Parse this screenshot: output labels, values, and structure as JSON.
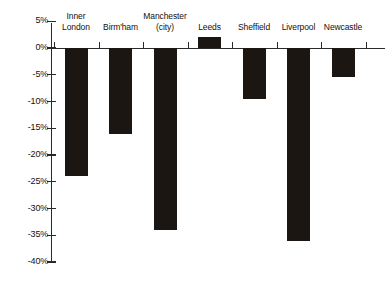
{
  "chart_data": {
    "type": "bar",
    "title": "",
    "subtitle": "",
    "xlabel": "",
    "ylabel": "",
    "categories": [
      "Inner\nLondon",
      "Birm'ham",
      "Manchester\n(city)",
      "Leeds",
      "Sheffield",
      "Liverpool",
      "Newcastle"
    ],
    "values": [
      -24,
      -16,
      -34,
      2,
      -9.5,
      -36,
      -5.5
    ],
    "ylim": [
      -40,
      5
    ],
    "ytick_values": [
      5,
      0,
      -5,
      -10,
      -15,
      -20,
      -25,
      -30,
      -35,
      -40
    ],
    "ytick_labels": [
      "5%",
      "0%",
      "-5%",
      "-10%",
      "-15%",
      "-20%",
      "-25%",
      "-30%",
      "-35%",
      "-40%"
    ],
    "grid": false,
    "legend": "none",
    "bar_color": "#1c1613",
    "axis_color": "#2a2a2a",
    "category_label_position": "above-plot"
  }
}
